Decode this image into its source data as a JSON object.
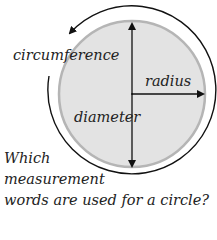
{
  "diagram": {
    "labels": {
      "circumference": "circumference",
      "radius": "radius",
      "diameter": "diameter"
    },
    "question": {
      "line1": "Which",
      "line2": "measurement",
      "line3": "words are used for a circle?"
    },
    "colors": {
      "circle_fill": "#e3e3e3",
      "circle_stroke": "#b5b5b5",
      "lines": "#111111"
    }
  }
}
